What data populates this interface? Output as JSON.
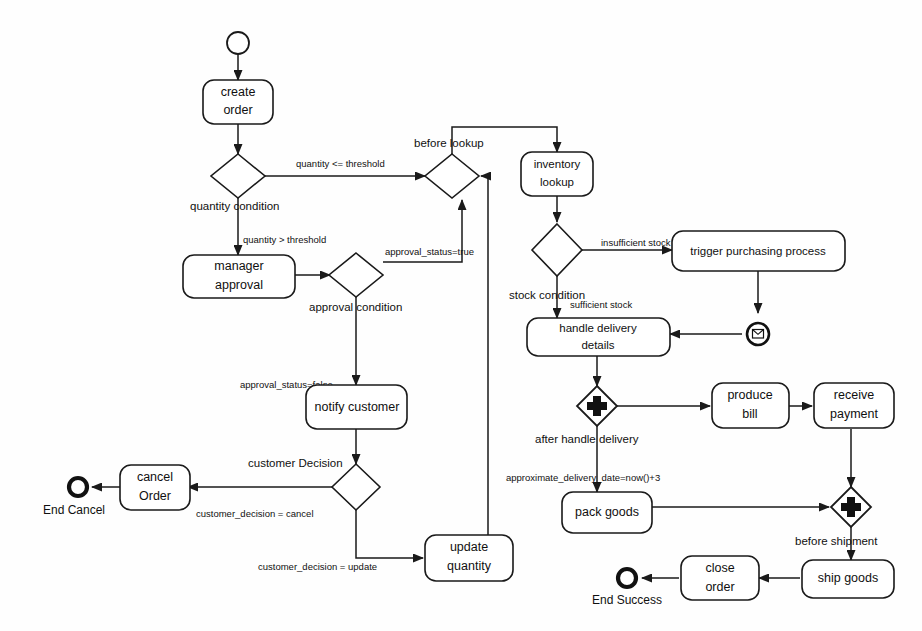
{
  "diagram": {
    "type": "uml-activity-diagram",
    "nodes": {
      "start": {
        "label": "",
        "kind": "initial-node"
      },
      "create_order": {
        "line1": "create",
        "line2": "order",
        "kind": "action"
      },
      "quantity_condition": {
        "label": "quantity condition",
        "kind": "decision"
      },
      "before_lookup": {
        "label": "before lookup",
        "kind": "merge"
      },
      "inventory_lookup": {
        "line1": "inventory",
        "line2": "lookup",
        "kind": "action"
      },
      "manager_approval": {
        "line1": "manager",
        "line2": "approval",
        "kind": "action"
      },
      "approval_condition": {
        "label": "approval condition",
        "kind": "decision"
      },
      "stock_condition": {
        "label": "stock condition",
        "kind": "decision"
      },
      "trigger_purchasing": {
        "label": "trigger purchasing process",
        "kind": "action"
      },
      "signal_receive": {
        "label": "",
        "kind": "signal-receipt"
      },
      "handle_delivery": {
        "line1": "handle delivery",
        "line2": "details",
        "kind": "action"
      },
      "after_handle_delivery": {
        "label": "after handle delivery",
        "kind": "fork"
      },
      "produce_bill": {
        "line1": "produce",
        "line2": "bill",
        "kind": "action"
      },
      "receive_payment": {
        "line1": "receive",
        "line2": "payment",
        "kind": "action"
      },
      "pack_goods": {
        "label": "pack goods",
        "kind": "action"
      },
      "before_shipment": {
        "label": "before shipment",
        "kind": "join"
      },
      "ship_goods": {
        "label": "ship goods",
        "kind": "action"
      },
      "close_order": {
        "line1": "close",
        "line2": "order",
        "kind": "action"
      },
      "end_success": {
        "label": "End Success",
        "kind": "final-node"
      },
      "notify_customer": {
        "label": "notify customer",
        "kind": "action"
      },
      "customer_decision": {
        "label": "customer Decision",
        "kind": "decision"
      },
      "cancel_order": {
        "line1": "cancel",
        "line2": "Order",
        "kind": "action"
      },
      "end_cancel": {
        "label": "End Cancel",
        "kind": "final-node"
      },
      "update_quantity": {
        "line1": "update",
        "line2": "quantity",
        "kind": "action"
      }
    },
    "edge_labels": {
      "quantity_le_threshold": "quantity <= threshold",
      "quantity_gt_threshold": "quantity > threshold",
      "approval_status_true": "approval_status=true",
      "approval_status_false": "approval_status=false",
      "insufficient_stock": "insufficient stock",
      "sufficient_stock": "sufficient stock",
      "approximate_delivery_date": "approximate_delivery_date=now()+3",
      "customer_decision_cancel": "customer_decision = cancel",
      "customer_decision_update": "customer_decision = update"
    },
    "colors": {
      "background": "#fefefe",
      "stroke": "#1a1a1a",
      "text": "#101010",
      "fill": "#ffffff"
    }
  }
}
